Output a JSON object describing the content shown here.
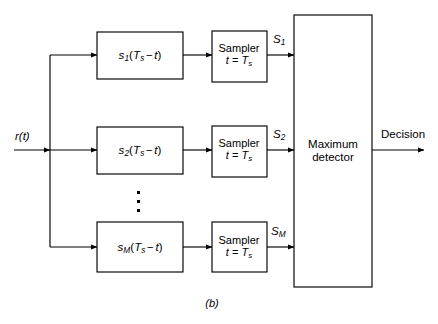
{
  "figure": {
    "caption": "(b)",
    "input_label": "r(t)",
    "output_label": "Decision",
    "detector": {
      "line1": "Maximum",
      "line2": "detector"
    },
    "branches": [
      {
        "index": "1",
        "filter": {
          "base": "s",
          "sub": "1",
          "arg_open": "(",
          "arg_T": "T",
          "arg_Tsub": "s",
          "minus": "−",
          "arg_t": "t",
          "arg_close": ")"
        },
        "sampler": {
          "line1": "Sampler",
          "line2_t": "t",
          "line2_eq": "=",
          "line2_T": "T",
          "line2_sub": "s"
        },
        "signal": {
          "base": "S",
          "sub": "1"
        }
      },
      {
        "index": "2",
        "filter": {
          "base": "s",
          "sub": "2",
          "arg_open": "(",
          "arg_T": "T",
          "arg_Tsub": "s",
          "minus": "−",
          "arg_t": "t",
          "arg_close": ")"
        },
        "sampler": {
          "line1": "Sampler",
          "line2_t": "t",
          "line2_eq": "=",
          "line2_T": "T",
          "line2_sub": "s"
        },
        "signal": {
          "base": "S",
          "sub": "2"
        }
      },
      {
        "index": "M",
        "filter": {
          "base": "s",
          "sub": "M",
          "arg_open": "(",
          "arg_T": "T",
          "arg_Tsub": "s",
          "minus": "−",
          "arg_t": "t",
          "arg_close": ")"
        },
        "sampler": {
          "line1": "Sampler",
          "line2_t": "t",
          "line2_eq": "=",
          "line2_T": "T",
          "line2_sub": "s"
        },
        "signal": {
          "base": "S",
          "sub": "M"
        }
      }
    ],
    "ellipsis": "vertical-dots",
    "colors": {
      "stroke": "#000000",
      "background": "#ffffff",
      "text": "#000000"
    }
  }
}
